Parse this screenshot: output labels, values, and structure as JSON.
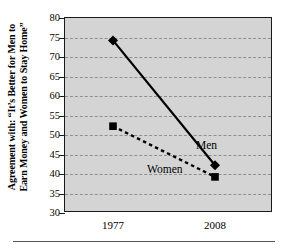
{
  "chart_data": {
    "type": "line",
    "title": "",
    "xlabel": "",
    "ylabel": "Agreement with: “It’s Better for Men to\nEarn Money and Women to Stay Home”",
    "categories": [
      "1977",
      "2008"
    ],
    "x": [
      1977,
      2008
    ],
    "xtick_labels": [
      "1977",
      "2008"
    ],
    "ytick_labels": [
      "80",
      "75",
      "70",
      "65",
      "60",
      "55",
      "50",
      "45",
      "40",
      "35",
      "30"
    ],
    "ytick_values": [
      80,
      75,
      70,
      65,
      60,
      55,
      50,
      45,
      40,
      35,
      30
    ],
    "ylim": [
      30,
      80
    ],
    "grid": true,
    "grid_style": "dashed horizontal",
    "legend_position": "inline annotations",
    "plot_background": "#d4d4d4",
    "series": [
      {
        "name": "Men",
        "values": [
          74,
          42
        ],
        "marker": "diamond",
        "line_style": "solid",
        "color": "#000000"
      },
      {
        "name": "Women",
        "values": [
          52,
          39
        ],
        "marker": "square",
        "line_style": "dashed",
        "color": "#000000"
      }
    ],
    "annotations": [
      {
        "text": "Men",
        "series": "Men"
      },
      {
        "text": "Women",
        "series": "Women"
      }
    ]
  },
  "axes": {
    "y_title_line1": "Agreement with: “It’s Better for Men to",
    "y_title_line2": "Earn Money and Women to Stay Home”",
    "y_ticks": [
      {
        "label": "80"
      },
      {
        "label": "75"
      },
      {
        "label": "70"
      },
      {
        "label": "65"
      },
      {
        "label": "60"
      },
      {
        "label": "55"
      },
      {
        "label": "50"
      },
      {
        "label": "45"
      },
      {
        "label": "40"
      },
      {
        "label": "35"
      },
      {
        "label": "30"
      }
    ],
    "x_ticks": [
      {
        "label": "1977"
      },
      {
        "label": "2008"
      }
    ]
  },
  "labels": {
    "men": "Men",
    "women": "Women"
  },
  "colors": {
    "plot_background": "#d4d4d4",
    "axis": "#1a1a1a",
    "grid": "#8f8f8f",
    "series": "#000000",
    "page_background": "#ffffff"
  }
}
